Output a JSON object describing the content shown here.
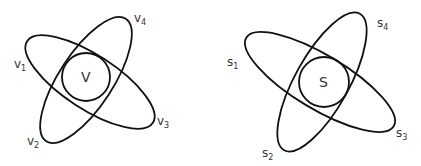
{
  "diagrams": [
    {
      "id": "left",
      "center_label": "V",
      "labels": [
        {
          "base": "v",
          "sub": "1"
        },
        {
          "base": "v",
          "sub": "2"
        },
        {
          "base": "v",
          "sub": "3"
        },
        {
          "base": "v",
          "sub": "4"
        }
      ]
    },
    {
      "id": "right",
      "center_label": "S",
      "labels": [
        {
          "base": "s",
          "sub": "1"
        },
        {
          "base": "s",
          "sub": "2"
        },
        {
          "base": "s",
          "sub": "3"
        },
        {
          "base": "s",
          "sub": "4"
        }
      ]
    }
  ],
  "colors": {
    "stroke": "#111111",
    "text": "#333333",
    "background": "#ffffff"
  }
}
